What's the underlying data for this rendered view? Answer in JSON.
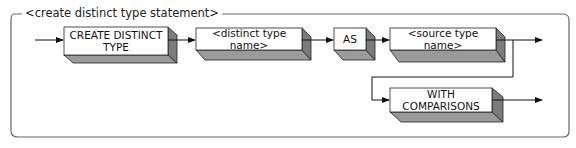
{
  "diagram": {
    "title": "<create distinct type statement>",
    "boxes": [
      {
        "id": "create-distinct-type",
        "label": "CREATE DISTINCT TYPE",
        "line1": "CREATE DISTINCT",
        "line2": "TYPE"
      },
      {
        "id": "distinct-type-name",
        "label": "<distinct type name>"
      },
      {
        "id": "as",
        "label": "AS"
      },
      {
        "id": "source-type-name",
        "label": "<source type name>"
      },
      {
        "id": "with-comparisons",
        "label": "WITH COMPARISONS"
      }
    ],
    "colors": {
      "face": "#ffffff",
      "side": "#8a8a8a",
      "bottom": "#9a9a9a",
      "line": "#222222",
      "frame": "#555555"
    }
  }
}
